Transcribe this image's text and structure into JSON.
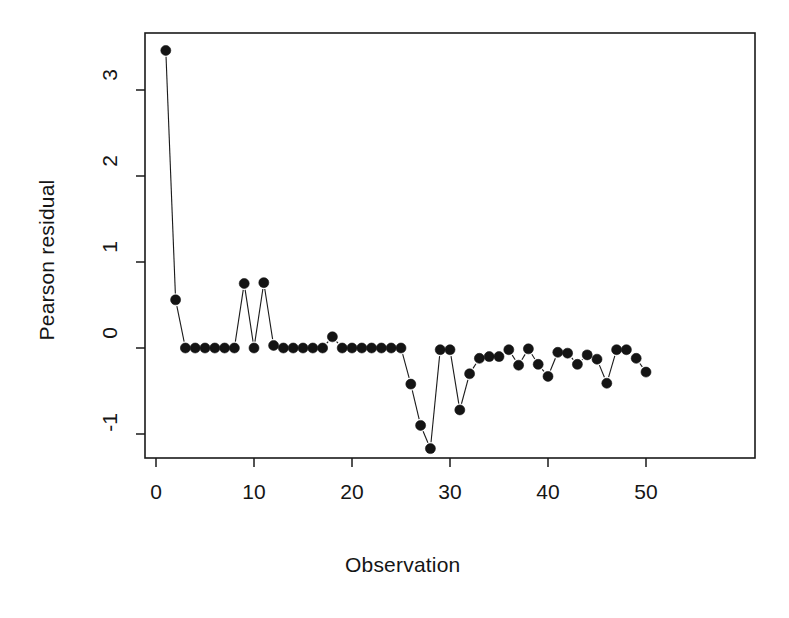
{
  "chart_data": {
    "type": "line",
    "title": "",
    "xlabel": "Observation",
    "ylabel": "Pearson residual",
    "xlim": [
      -0.1,
      62
    ],
    "ylim": [
      -1.45,
      3.75
    ],
    "grid": false,
    "legend": null,
    "marker": "filled-circle",
    "line_style": "solid-thin",
    "xticks": [
      0,
      10,
      20,
      30,
      40,
      50
    ],
    "xtick_labels": [
      "0",
      "10",
      "20",
      "30",
      "40",
      "50"
    ],
    "yticks": [
      -1,
      0,
      1,
      2,
      3
    ],
    "ytick_labels": [
      "-1",
      "0",
      "1",
      "2",
      "3"
    ],
    "x": [
      1,
      2,
      3,
      4,
      5,
      6,
      7,
      8,
      9,
      10,
      11,
      12,
      13,
      14,
      15,
      16,
      17,
      18,
      19,
      20,
      21,
      22,
      23,
      24,
      25,
      26,
      27,
      28,
      29,
      30,
      31,
      32,
      33,
      34,
      35,
      36,
      37,
      38,
      39,
      40,
      41,
      42,
      43,
      44,
      45,
      46,
      47,
      48,
      49,
      50
    ],
    "values": [
      3.46,
      0.56,
      0.0,
      0.0,
      0.0,
      0.0,
      0.0,
      0.0,
      0.75,
      0.0,
      0.76,
      0.03,
      0.0,
      0.0,
      0.0,
      0.0,
      0.0,
      0.13,
      0.0,
      0.0,
      0.0,
      0.0,
      0.0,
      0.0,
      0.0,
      -0.42,
      -0.9,
      -1.17,
      -0.02,
      -0.02,
      -0.72,
      -0.3,
      -0.12,
      -0.1,
      -0.1,
      -0.02,
      -0.2,
      -0.01,
      -0.19,
      -0.33,
      -0.05,
      -0.06,
      -0.19,
      -0.08,
      -0.13,
      -0.41,
      -0.02,
      -0.02,
      -0.12,
      -0.28
    ]
  },
  "axes": {
    "ylabel_text": "Pearson residual",
    "xlabel_text": "Observation"
  }
}
